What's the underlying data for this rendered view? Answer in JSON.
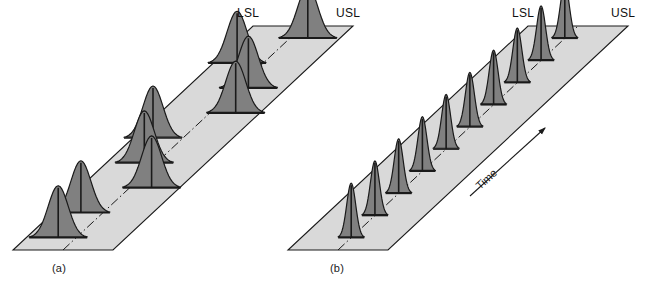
{
  "figure": {
    "background_color": "#ffffff",
    "outline_color": "#1a1a1a",
    "plane_fill_color": "#d9d9d9",
    "curve_fill_color": "#808080",
    "curve_outline_color": "#1a1a1a",
    "centerline_style": "dash-dot"
  },
  "panels": [
    {
      "id": "a",
      "caption": "(a)",
      "lsl_label": "LSL",
      "usl_label": "USL",
      "description": "Out-of-control process: wide distributions whose means wander back and forth across the centerline, some spilling past the specification limits.",
      "plane": {
        "bl_x": 13,
        "bl_y": 250,
        "br_x": 113,
        "br_y": 250,
        "tr_x": 353,
        "tr_y": 26,
        "tl_x": 253,
        "tl_y": 26
      },
      "curve_count": 9,
      "curve_shape": "wide",
      "curves": [
        {
          "t": 0,
          "offset": -0.18,
          "width": 1.0,
          "height": 1.0
        },
        {
          "t": 1,
          "offset": -0.22,
          "width": 1.0,
          "height": 1.0
        },
        {
          "t": 2,
          "offset": 0.22,
          "width": 1.0,
          "height": 1.0
        },
        {
          "t": 3,
          "offset": -0.12,
          "width": 1.0,
          "height": 1.0
        },
        {
          "t": 4,
          "offset": -0.3,
          "width": 1.0,
          "height": 1.0
        },
        {
          "t": 5,
          "offset": 0.26,
          "width": 1.0,
          "height": 1.0
        },
        {
          "t": 6,
          "offset": 0.12,
          "width": 1.0,
          "height": 1.0
        },
        {
          "t": 7,
          "offset": -0.26,
          "width": 1.0,
          "height": 1.0
        },
        {
          "t": 8,
          "offset": 0.18,
          "width": 1.0,
          "height": 1.0
        }
      ]
    },
    {
      "id": "b",
      "caption": "(b)",
      "lsl_label": "LSL",
      "usl_label": "USL",
      "time_label": "Time",
      "description": "In-control capable process: narrow distributions centered on the centerline, stable over time and well inside the specification limits.",
      "plane": {
        "bl_x": 288,
        "bl_y": 250,
        "br_x": 388,
        "br_y": 250,
        "tr_x": 628,
        "tr_y": 26,
        "tl_x": 528,
        "tl_y": 26
      },
      "curve_count": 10,
      "curve_shape": "narrow",
      "curves": [
        {
          "t": 0,
          "offset": 0.0,
          "width": 0.45,
          "height": 1.05
        },
        {
          "t": 1,
          "offset": 0.0,
          "width": 0.45,
          "height": 1.05
        },
        {
          "t": 2,
          "offset": 0.0,
          "width": 0.45,
          "height": 1.05
        },
        {
          "t": 3,
          "offset": 0.0,
          "width": 0.45,
          "height": 1.05
        },
        {
          "t": 4,
          "offset": 0.0,
          "width": 0.45,
          "height": 1.05
        },
        {
          "t": 5,
          "offset": 0.0,
          "width": 0.45,
          "height": 1.05
        },
        {
          "t": 6,
          "offset": 0.0,
          "width": 0.45,
          "height": 1.05
        },
        {
          "t": 7,
          "offset": 0.0,
          "width": 0.45,
          "height": 1.05
        },
        {
          "t": 8,
          "offset": 0.0,
          "width": 0.45,
          "height": 1.05
        },
        {
          "t": 9,
          "offset": 0.0,
          "width": 0.45,
          "height": 1.05
        }
      ]
    }
  ]
}
